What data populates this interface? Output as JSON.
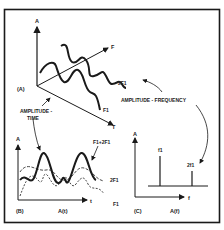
{
  "panelA": {
    "tag": "(A)",
    "axis_amplitude": "A",
    "axis_frequency": "F",
    "axis_time": "T",
    "wave_f1": "F1",
    "wave_2f1": "2F1",
    "label_amplitude_time_1": "AMPLITUDE -",
    "label_amplitude_time_2": "TIME",
    "label_amplitude_frequency": "AMPLITUDE - FREQUENCY"
  },
  "panelB": {
    "tag": "(B)",
    "axis_y": "A",
    "axis_x": "t",
    "caption": "A(t)",
    "curve_sum": "F1+2F1",
    "curve_2f1": "2F1",
    "curve_f1": "F1"
  },
  "panelC": {
    "tag": "(C)",
    "axis_y": "A",
    "axis_x": "f",
    "caption": "A(f)",
    "line_f1": "f1",
    "line_2f1": "2f1"
  },
  "colors": {
    "ink": "#1a1a1a",
    "background": "#ffffff"
  }
}
